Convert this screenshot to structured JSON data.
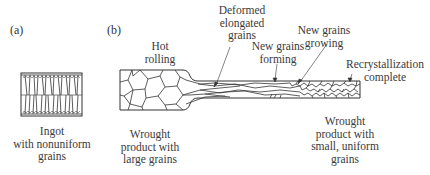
{
  "panels": {
    "a": {
      "label": "(a)",
      "caption": [
        "Ingot",
        "with nonuniform",
        "grains"
      ]
    },
    "b": {
      "label": "(b)",
      "process_label": [
        "Hot",
        "rolling"
      ],
      "caption_left": [
        "Wrought",
        "product with",
        "large grains"
      ],
      "caption_right": [
        "Wrought",
        "product with",
        "small, uniform",
        "grains"
      ],
      "annotations": {
        "deformed": [
          "Deformed",
          "elongated",
          "grains"
        ],
        "forming": [
          "New grains",
          "forming"
        ],
        "growing": [
          "New grains",
          "growing"
        ],
        "complete": [
          "Recrystallization",
          "complete"
        ]
      }
    }
  },
  "colors": {
    "line": "#333333",
    "text": "#3a3a3a",
    "background": "#ffffff"
  }
}
